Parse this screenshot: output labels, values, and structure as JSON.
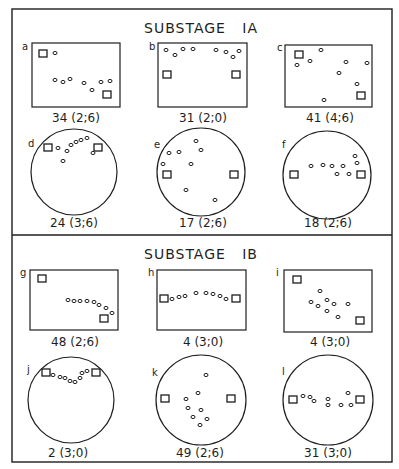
{
  "sections": [
    {
      "title": "SUBSTAGE   IA",
      "panels": [
        {
          "letter": "a",
          "shape": "rect",
          "caption": "34 (2;6)",
          "squares": [
            [
              43,
              54
            ],
            [
              107,
              95
            ]
          ],
          "dots": [
            [
              55,
              53
            ],
            [
              55,
              80
            ],
            [
              63,
              82
            ],
            [
              70,
              79
            ],
            [
              84,
              83
            ],
            [
              92,
              90
            ],
            [
              101,
              82
            ],
            [
              110,
              81
            ]
          ]
        },
        {
          "letter": "b",
          "shape": "rect",
          "caption": "31 (2;0)",
          "squares": [
            [
              167,
              75
            ],
            [
              236,
              75
            ]
          ],
          "dots": [
            [
              166,
              50
            ],
            [
              175,
              55
            ],
            [
              183,
              49
            ],
            [
              193,
              49
            ],
            [
              216,
              50
            ],
            [
              226,
              52
            ],
            [
              233,
              57
            ],
            [
              239,
              51
            ]
          ]
        },
        {
          "letter": "c",
          "shape": "rect",
          "caption": "41 (4;6)",
          "squares": [
            [
              299,
              55
            ],
            [
              361,
              96
            ]
          ],
          "dots": [
            [
              321,
              50
            ],
            [
              310,
              61
            ],
            [
              297,
              65
            ],
            [
              346,
              62
            ],
            [
              367,
              63
            ],
            [
              339,
              73
            ],
            [
              357,
              84
            ],
            [
              324,
              100
            ]
          ]
        },
        {
          "letter": "d",
          "shape": "circle",
          "caption": "24 (3;6)",
          "cx": 74,
          "cy": 172,
          "r": 43,
          "squares": [
            [
              48,
              148
            ],
            [
              98,
              148
            ]
          ],
          "dots": [
            [
              58,
              148
            ],
            [
              67,
              151
            ],
            [
              71,
              145
            ],
            [
              76,
              142
            ],
            [
              81,
              140
            ],
            [
              87,
              138
            ],
            [
              93,
              153
            ],
            [
              63,
              161
            ]
          ]
        },
        {
          "letter": "e",
          "shape": "circle",
          "caption": "17 (2;6)",
          "cx": 201,
          "cy": 172,
          "r": 44,
          "squares": [
            [
              167,
              175
            ],
            [
              234,
              175
            ]
          ],
          "dots": [
            [
              196,
              141
            ],
            [
              201,
              150
            ],
            [
              169,
              153
            ],
            [
              179,
              152
            ],
            [
              191,
              164
            ],
            [
              163,
              164
            ],
            [
              186,
              190
            ],
            [
              215,
              200
            ]
          ]
        },
        {
          "letter": "f",
          "shape": "circle",
          "caption": "18 (2;6)",
          "cx": 327,
          "cy": 175,
          "r": 44,
          "squares": [
            [
              294,
              175
            ],
            [
              361,
              175
            ]
          ],
          "dots": [
            [
              311,
              166
            ],
            [
              323,
              165
            ],
            [
              332,
              166
            ],
            [
              343,
              166
            ],
            [
              337,
              174
            ],
            [
              349,
              174
            ],
            [
              355,
              156
            ],
            [
              357,
              163
            ]
          ]
        }
      ]
    },
    {
      "title": "SUBSTAGE   IB",
      "panels": [
        {
          "letter": "g",
          "shape": "rect",
          "caption": "48 (2;6)",
          "squares": [
            [
              42,
              279
            ],
            [
              104,
              319
            ]
          ],
          "dots": [
            [
              68,
              300
            ],
            [
              74,
              301
            ],
            [
              80,
              301
            ],
            [
              87,
              301
            ],
            [
              94,
              302
            ],
            [
              99,
              305
            ],
            [
              106,
              308
            ],
            [
              112,
              313
            ]
          ]
        },
        {
          "letter": "h",
          "shape": "rect",
          "caption": "4 (3;0)",
          "squares": [
            [
              164,
              299
            ],
            [
              236,
              299
            ]
          ],
          "dots": [
            [
              172,
              299
            ],
            [
              179,
              297
            ],
            [
              185,
              296
            ],
            [
              196,
              293
            ],
            [
              206,
              293
            ],
            [
              213,
              294
            ],
            [
              220,
              296
            ],
            [
              226,
              299
            ]
          ]
        },
        {
          "letter": "i",
          "shape": "rect",
          "caption": "4 (3;0)",
          "squares": [
            [
              297,
              280
            ],
            [
              360,
              321
            ]
          ],
          "dots": [
            [
              320,
              291
            ],
            [
              311,
              302
            ],
            [
              318,
              306
            ],
            [
              327,
              300
            ],
            [
              334,
              304
            ],
            [
              348,
              304
            ],
            [
              327,
              311
            ],
            [
              338,
              317
            ]
          ]
        },
        {
          "letter": "j",
          "shape": "circle",
          "caption": "2 (3;0)",
          "cx": 71,
          "cy": 400,
          "r": 43,
          "squares": [
            [
              46,
              373
            ],
            [
              96,
              373
            ]
          ],
          "dots": [
            [
              53,
              375
            ],
            [
              60,
              377
            ],
            [
              65,
              378
            ],
            [
              70,
              381
            ],
            [
              75,
              382
            ],
            [
              80,
              378
            ],
            [
              82,
              373
            ],
            [
              87,
              371
            ]
          ]
        },
        {
          "letter": "k",
          "shape": "circle",
          "caption": "49 (2;6)",
          "cx": 201,
          "cy": 400,
          "r": 45,
          "squares": [
            [
              165,
              399
            ],
            [
              231,
              399
            ]
          ],
          "dots": [
            [
              206,
              375
            ],
            [
              198,
              393
            ],
            [
              186,
              399
            ],
            [
              188,
              408
            ],
            [
              201,
              410
            ],
            [
              193,
              417
            ],
            [
              207,
              419
            ],
            [
              200,
              425
            ]
          ]
        },
        {
          "letter": "l",
          "shape": "circle",
          "caption": "31 (3;0)",
          "cx": 328,
          "cy": 400,
          "r": 45,
          "squares": [
            [
              293,
              400
            ],
            [
              360,
              400
            ]
          ],
          "dots": [
            [
              303,
              396
            ],
            [
              310,
              397
            ],
            [
              314,
              401
            ],
            [
              328,
              399
            ],
            [
              328,
              405
            ],
            [
              341,
              405
            ],
            [
              348,
              393
            ],
            [
              351,
              405
            ]
          ]
        }
      ]
    }
  ]
}
